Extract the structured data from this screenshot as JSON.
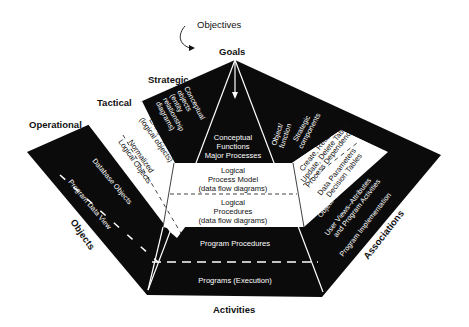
{
  "diagram": {
    "top_labels": {
      "objectives": "Objectives",
      "goals": "Goals"
    },
    "level_labels": {
      "strategic": "Strategic",
      "tactical": "Tactical",
      "operational": "Operational"
    },
    "axis_labels": {
      "objects": "Objects",
      "activities": "Activities",
      "associations": "Associations"
    },
    "center": {
      "conceptual": [
        "Conceptual",
        "Functions",
        "Major Processes"
      ],
      "logical_process": [
        "Logical",
        "Process Model",
        "(data flow diagrams)"
      ],
      "logical_procedures": [
        "Logical",
        "Procedures",
        "(data flow diagrams)"
      ],
      "program_procedures": "Program Procedures",
      "programs": "Programs (Execution)"
    },
    "left": {
      "strategic": [
        "Conceptual",
        "objects",
        "(entity",
        "relationship",
        "diagrams)"
      ],
      "tactical_1": [
        "Entity Types",
        "(logical objects)"
      ],
      "tactical_2": [
        "Normalized",
        "Logical Objects"
      ],
      "operational_1": "Database Objects",
      "operational_2": "Program Data View"
    },
    "right": {
      "strategic_1": [
        "Object/",
        "function"
      ],
      "strategic_2": [
        "Strategic",
        "components"
      ],
      "tactical_1": [
        "Create, Read,",
        "Update, Delete Tables"
      ],
      "tactical_2": "Process Dependence",
      "tactical_3": [
        "Data Parameters",
        "Decision Tables"
      ],
      "operational_1": "Object–Procedure",
      "operational_2": [
        "User Views–Attributes",
        "and Program Activities"
      ],
      "operational_3": "Program Implementation"
    },
    "colors": {
      "band_dark": "#0b0b0b",
      "band_light": "#ffffff",
      "text": "#111111"
    }
  }
}
